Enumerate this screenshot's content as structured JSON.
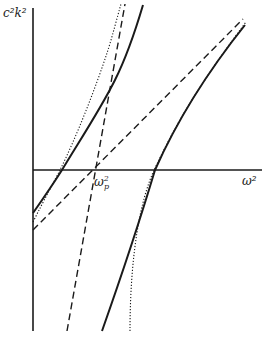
{
  "figure": {
    "y_axis_label": {
      "base": "c²k²"
    },
    "x_axis_label": {
      "base": "ω²"
    },
    "plasma_freq_label": {
      "base": "ω",
      "sup": "2",
      "sub": "p"
    }
  },
  "curves": [
    {
      "name": "upper-solid-branch",
      "style": "solid"
    },
    {
      "name": "upper-dotted-branch",
      "style": "dotted"
    },
    {
      "name": "steep-dashed-asymptote",
      "style": "dashed"
    },
    {
      "name": "shallow-dashed-asymptote",
      "style": "dashed"
    },
    {
      "name": "lower-solid-branch",
      "style": "solid"
    },
    {
      "name": "lower-dotted-branch",
      "style": "dotted"
    }
  ],
  "colors": {
    "ink": "#1a1a1a",
    "background": "#ffffff"
  }
}
